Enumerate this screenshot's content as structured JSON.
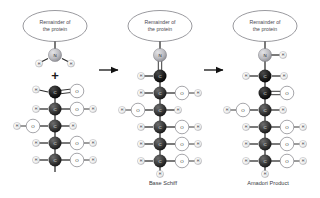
{
  "figure": {
    "background_color": "#ffffff"
  },
  "palette": {
    "carbon": "#3a3a3a",
    "carbon_dark": "#1e1e1e",
    "nitrogen": "#b9b9bd",
    "oxygen": "#ffffff",
    "hydrogen": "#f2f2f2",
    "bond": "#2b2b2b",
    "text": "#3a3a42",
    "ellipse_stroke": "#6e6e76",
    "arrow": "#111111"
  },
  "panels": [
    {
      "id": "reactants",
      "protein_label_line1": "Remainder of",
      "protein_label_line2": "the protein",
      "caption": "",
      "operator": "+",
      "amine": {
        "center_atom": "N",
        "substituents": [
          "H",
          "H"
        ]
      },
      "sugar_chain": [
        {
          "center": "C",
          "left": "H",
          "right": "O",
          "right_bond": "double",
          "right_terminal": ""
        },
        {
          "center": "C",
          "left": "H",
          "right": "O",
          "right_bond": "single",
          "right_terminal": "H"
        },
        {
          "center": "C",
          "left": "O",
          "left_terminal": "H",
          "right": "H",
          "right_bond": "single"
        },
        {
          "center": "C",
          "left": "H",
          "right": "O",
          "right_bond": "single",
          "right_terminal": "H"
        },
        {
          "center": "C",
          "left": "H",
          "right": "O",
          "right_bond": "single",
          "right_terminal": "H"
        },
        {
          "center": "C",
          "left": "H",
          "right": "O",
          "right_bond": "single",
          "right_terminal": "H",
          "bottom": "H"
        }
      ]
    },
    {
      "id": "schiff-base",
      "protein_label_line1": "Remainder of",
      "protein_label_line2": "the protein",
      "caption": "Base Schiff",
      "operator": "",
      "amine": {
        "center_atom": "N",
        "substituents": []
      },
      "sugar_chain": [
        {
          "center": "C",
          "left": "H",
          "right": "",
          "right_bond": "none",
          "right_terminal": ""
        },
        {
          "center": "C",
          "left": "H",
          "right": "O",
          "right_bond": "single",
          "right_terminal": "H"
        },
        {
          "center": "C",
          "left": "H",
          "right": "O",
          "right_bond": "single",
          "right_terminal": "H"
        },
        {
          "center": "C",
          "left": "O",
          "left_terminal": "H",
          "right": "H",
          "right_bond": "single"
        },
        {
          "center": "C",
          "left": "H",
          "right": "O",
          "right_bond": "single",
          "right_terminal": "H"
        },
        {
          "center": "C",
          "left": "H",
          "right": "O",
          "right_bond": "single",
          "right_terminal": "H"
        },
        {
          "center": "C",
          "left": "H",
          "right": "O",
          "right_bond": "single",
          "right_terminal": "H",
          "bottom": "H"
        }
      ]
    },
    {
      "id": "amadori-product",
      "protein_label_line1": "Remainder of",
      "protein_label_line2": "the protein",
      "caption": "Amadori Product",
      "operator": "",
      "amine": {
        "center_atom": "N",
        "substituents": [
          "H"
        ]
      },
      "sugar_chain": [
        {
          "center": "C",
          "left": "H",
          "right": "H",
          "right_bond": "single"
        },
        {
          "center": "C",
          "left": "",
          "right": "O",
          "right_bond": "double",
          "right_terminal": ""
        },
        {
          "center": "C",
          "left": "O",
          "left_terminal": "H",
          "right": "H",
          "right_bond": "single"
        },
        {
          "center": "C",
          "left": "H",
          "right": "O",
          "right_bond": "single",
          "right_terminal": "H"
        },
        {
          "center": "C",
          "left": "H",
          "right": "O",
          "right_bond": "single",
          "right_terminal": "H"
        },
        {
          "center": "C",
          "left": "H",
          "right": "O",
          "right_bond": "single",
          "right_terminal": "H",
          "bottom": "H"
        }
      ]
    }
  ],
  "arrows": [
    {
      "id": "arrow-1",
      "direction": "right"
    },
    {
      "id": "arrow-2",
      "direction": "right"
    }
  ],
  "atom_symbols": {
    "nitrogen": "N",
    "carbon": "C",
    "oxygen": "O",
    "hydrogen": "H"
  }
}
